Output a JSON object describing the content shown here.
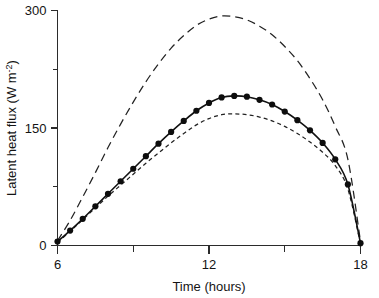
{
  "chart_data": {
    "type": "line",
    "title": "",
    "xlabel": "Time (hours)",
    "ylabel": "Latent heat flux (W m",
    "ylabel_superscript": "-2",
    "ylabel_suffix": ")",
    "xlim": [
      6,
      18
    ],
    "ylim": [
      0,
      300
    ],
    "xticks": [
      6,
      12,
      18
    ],
    "xtick_labels": [
      "6",
      "12",
      "18"
    ],
    "xminor_ticks": [
      9,
      15
    ],
    "yticks": [
      0,
      150,
      300
    ],
    "ytick_labels": [
      "0",
      "150",
      "300"
    ],
    "yminor_ticks": [
      75,
      225
    ],
    "grid": false,
    "legend": "none",
    "x": [
      6,
      6.5,
      7,
      7.5,
      8,
      8.5,
      9,
      9.5,
      10,
      10.5,
      11,
      11.5,
      12,
      12.5,
      13,
      13.5,
      14,
      14.5,
      15,
      15.5,
      16,
      16.5,
      17,
      17.5,
      18
    ],
    "series": [
      {
        "name": "upper-long-dashed",
        "style": "long-dashed",
        "markers": false,
        "values": [
          6,
          32,
          62,
          93,
          125,
          155,
          183,
          209,
          232,
          252,
          268,
          281,
          289,
          293,
          292,
          288,
          280,
          269,
          254,
          236,
          213,
          186,
          152,
          110,
          5
        ]
      },
      {
        "name": "measured-solid-with-circles",
        "style": "solid",
        "markers": true,
        "values": [
          5,
          19,
          34,
          50,
          66,
          82,
          98,
          114,
          130,
          145,
          159,
          172,
          182,
          189,
          191,
          190,
          186,
          180,
          171,
          160,
          147,
          131,
          110,
          78,
          3
        ]
      },
      {
        "name": "lower-short-dashed",
        "style": "short-dashed",
        "markers": false,
        "values": [
          4,
          18,
          33,
          48,
          63,
          77,
          91,
          105,
          118,
          131,
          143,
          154,
          162,
          167,
          168,
          167,
          164,
          159,
          152,
          143,
          132,
          119,
          102,
          72,
          2
        ]
      }
    ],
    "colors": {
      "axis": "#2b2b2b",
      "solid_line": "#111111",
      "dashed_line": "#222222",
      "marker": "#0d0d0d",
      "background": "#ffffff"
    }
  }
}
